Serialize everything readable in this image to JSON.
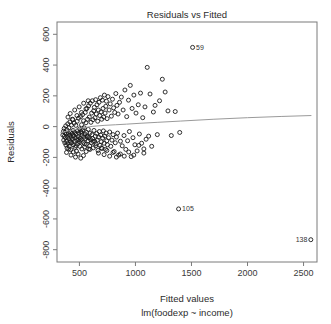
{
  "chart_data": {
    "type": "scatter",
    "title": "Residuals vs Fitted",
    "xlabel": "Fitted values",
    "sublabel": "lm(foodexp ~ income)",
    "ylabel": "Residuals",
    "xlim": [
      300,
      2620
    ],
    "ylim": [
      -880,
      680
    ],
    "xticks": [
      500,
      1000,
      1500,
      2000,
      2500
    ],
    "xtick_labels": [
      "500",
      "1000",
      "1500",
      "2000",
      "2500"
    ],
    "yticks": [
      600,
      400,
      200,
      0,
      -200,
      -400,
      -600,
      -800
    ],
    "ytick_labels": [
      "600",
      "400",
      "200",
      "0",
      "-200",
      "-400",
      "-600",
      "-800"
    ],
    "grid": false,
    "legend": "none",
    "marker": "open-circle",
    "marker_color": "#1a1a1a",
    "smoother_color": "#9a9a9a",
    "frame_color": "#7a7a7a",
    "background": "#ffffff",
    "labeled_points": [
      {
        "id": "59",
        "x": 1510,
        "y": 515,
        "label_side": "right"
      },
      {
        "id": "105",
        "x": 1385,
        "y": -535,
        "label_side": "right"
      },
      {
        "id": "138",
        "x": 2565,
        "y": -735,
        "label_side": "left"
      }
    ],
    "smooth_line": [
      [
        330,
        -40
      ],
      [
        420,
        -25
      ],
      [
        520,
        -10
      ],
      [
        620,
        2
      ],
      [
        720,
        8
      ],
      [
        820,
        12
      ],
      [
        920,
        16
      ],
      [
        1050,
        22
      ],
      [
        1200,
        28
      ],
      [
        1400,
        36
      ],
      [
        1700,
        48
      ],
      [
        2000,
        58
      ],
      [
        2300,
        66
      ],
      [
        2570,
        72
      ]
    ],
    "points": [
      [
        352,
        -55
      ],
      [
        358,
        -30
      ],
      [
        360,
        -88
      ],
      [
        364,
        -12
      ],
      [
        366,
        -62
      ],
      [
        370,
        -105
      ],
      [
        372,
        -38
      ],
      [
        375,
        -72
      ],
      [
        378,
        5
      ],
      [
        380,
        -120
      ],
      [
        383,
        -48
      ],
      [
        386,
        -95
      ],
      [
        388,
        -20
      ],
      [
        390,
        -140
      ],
      [
        393,
        -65
      ],
      [
        396,
        18
      ],
      [
        398,
        -110
      ],
      [
        401,
        -42
      ],
      [
        404,
        -78
      ],
      [
        406,
        -8
      ],
      [
        409,
        -128
      ],
      [
        412,
        -55
      ],
      [
        415,
        30
      ],
      [
        418,
        -92
      ],
      [
        420,
        -35
      ],
      [
        423,
        -150
      ],
      [
        426,
        -68
      ],
      [
        429,
        10
      ],
      [
        432,
        -105
      ],
      [
        435,
        -45
      ],
      [
        438,
        -82
      ],
      [
        441,
        45
      ],
      [
        444,
        -25
      ],
      [
        447,
        -118
      ],
      [
        450,
        -60
      ],
      [
        453,
        22
      ],
      [
        456,
        -95
      ],
      [
        459,
        -38
      ],
      [
        462,
        -135
      ],
      [
        465,
        -72
      ],
      [
        468,
        8
      ],
      [
        471,
        -50
      ],
      [
        474,
        -160
      ],
      [
        477,
        -88
      ],
      [
        480,
        35
      ],
      [
        483,
        -28
      ],
      [
        486,
        -112
      ],
      [
        489,
        -65
      ],
      [
        492,
        55
      ],
      [
        495,
        -42
      ],
      [
        498,
        -98
      ],
      [
        501,
        -15
      ],
      [
        504,
        -128
      ],
      [
        507,
        -75
      ],
      [
        510,
        65
      ],
      [
        513,
        -32
      ],
      [
        516,
        -88
      ],
      [
        519,
        12
      ],
      [
        522,
        -145
      ],
      [
        525,
        -58
      ],
      [
        528,
        78
      ],
      [
        531,
        -22
      ],
      [
        534,
        -102
      ],
      [
        537,
        38
      ],
      [
        540,
        -68
      ],
      [
        543,
        -8
      ],
      [
        546,
        -132
      ],
      [
        549,
        -48
      ],
      [
        552,
        92
      ],
      [
        555,
        -78
      ],
      [
        558,
        25
      ],
      [
        561,
        -115
      ],
      [
        564,
        -38
      ],
      [
        567,
        118
      ],
      [
        570,
        -62
      ],
      [
        573,
        48
      ],
      [
        576,
        -92
      ],
      [
        579,
        -18
      ],
      [
        582,
        135
      ],
      [
        585,
        -72
      ],
      [
        588,
        62
      ],
      [
        591,
        -125
      ],
      [
        594,
        -42
      ],
      [
        597,
        152
      ],
      [
        600,
        -85
      ],
      [
        603,
        28
      ],
      [
        606,
        -105
      ],
      [
        609,
        88
      ],
      [
        612,
        -52
      ],
      [
        615,
        168
      ],
      [
        618,
        -78
      ],
      [
        621,
        45
      ],
      [
        624,
        -138
      ],
      [
        627,
        102
      ],
      [
        630,
        -25
      ],
      [
        633,
        125
      ],
      [
        636,
        -95
      ],
      [
        639,
        58
      ],
      [
        642,
        -62
      ],
      [
        645,
        175
      ],
      [
        648,
        -112
      ],
      [
        651,
        82
      ],
      [
        654,
        -45
      ],
      [
        657,
        142
      ],
      [
        660,
        -88
      ],
      [
        663,
        35
      ],
      [
        666,
        -155
      ],
      [
        669,
        108
      ],
      [
        672,
        -68
      ],
      [
        675,
        158
      ],
      [
        678,
        -32
      ],
      [
        681,
        72
      ],
      [
        684,
        -122
      ],
      [
        687,
        188
      ],
      [
        690,
        -55
      ],
      [
        693,
        95
      ],
      [
        696,
        -98
      ],
      [
        699,
        48
      ],
      [
        702,
        -142
      ],
      [
        705,
        172
      ],
      [
        708,
        -75
      ],
      [
        711,
        118
      ],
      [
        714,
        -28
      ],
      [
        717,
        62
      ],
      [
        720,
        -108
      ],
      [
        723,
        205
      ],
      [
        726,
        -62
      ],
      [
        729,
        88
      ],
      [
        732,
        -148
      ],
      [
        735,
        132
      ],
      [
        738,
        -42
      ],
      [
        741,
        165
      ],
      [
        744,
        -92
      ],
      [
        747,
        52
      ],
      [
        750,
        -118
      ],
      [
        755,
        195
      ],
      [
        760,
        -72
      ],
      [
        765,
        108
      ],
      [
        770,
        -35
      ],
      [
        775,
        148
      ],
      [
        780,
        -128
      ],
      [
        785,
        68
      ],
      [
        790,
        -88
      ],
      [
        795,
        178
      ],
      [
        800,
        -52
      ],
      [
        805,
        122
      ],
      [
        810,
        -162
      ],
      [
        815,
        92
      ],
      [
        820,
        -105
      ],
      [
        825,
        215
      ],
      [
        830,
        -68
      ],
      [
        835,
        138
      ],
      [
        840,
        -42
      ],
      [
        845,
        82
      ],
      [
        850,
        -185
      ],
      [
        858,
        158
      ],
      [
        866,
        -95
      ],
      [
        874,
        192
      ],
      [
        882,
        -125
      ],
      [
        890,
        108
      ],
      [
        898,
        -58
      ],
      [
        906,
        238
      ],
      [
        914,
        -148
      ],
      [
        922,
        65
      ],
      [
        930,
        -92
      ],
      [
        938,
        172
      ],
      [
        946,
        -32
      ],
      [
        954,
        268
      ],
      [
        962,
        -195
      ],
      [
        970,
        118
      ],
      [
        978,
        -72
      ],
      [
        986,
        205
      ],
      [
        995,
        -118
      ],
      [
        1005,
        88
      ],
      [
        1015,
        -158
      ],
      [
        1025,
        142
      ],
      [
        1035,
        -48
      ],
      [
        1045,
        218
      ],
      [
        1055,
        -108
      ],
      [
        1065,
        58
      ],
      [
        1075,
        -172
      ],
      [
        1085,
        128
      ],
      [
        1095,
        -82
      ],
      [
        1105,
        385
      ],
      [
        1118,
        -62
      ],
      [
        1130,
        212
      ],
      [
        1145,
        -128
      ],
      [
        1160,
        95
      ],
      [
        1175,
        138
      ],
      [
        1195,
        -52
      ],
      [
        1215,
        168
      ],
      [
        1240,
        308
      ],
      [
        1265,
        225
      ],
      [
        1290,
        102
      ],
      [
        1320,
        -58
      ],
      [
        1355,
        98
      ],
      [
        1395,
        -38
      ],
      [
        420,
        -102
      ],
      [
        445,
        -58
      ],
      [
        470,
        -125
      ],
      [
        495,
        -85
      ],
      [
        520,
        -42
      ],
      [
        545,
        -112
      ],
      [
        570,
        -68
      ],
      [
        595,
        -148
      ],
      [
        620,
        -95
      ],
      [
        645,
        -125
      ],
      [
        670,
        -172
      ],
      [
        695,
        -138
      ],
      [
        720,
        -182
      ],
      [
        745,
        -155
      ],
      [
        770,
        -192
      ],
      [
        800,
        -168
      ],
      [
        830,
        -198
      ],
      [
        865,
        -178
      ],
      [
        900,
        -192
      ],
      [
        940,
        -165
      ],
      [
        985,
        -185
      ],
      [
        1030,
        -122
      ],
      [
        1075,
        -145
      ],
      [
        398,
        62
      ],
      [
        418,
        85
      ],
      [
        438,
        48
      ],
      [
        458,
        108
      ],
      [
        478,
        72
      ],
      [
        498,
        128
      ],
      [
        518,
        92
      ],
      [
        538,
        152
      ],
      [
        558,
        115
      ],
      [
        578,
        168
      ],
      [
        385,
        -168
      ],
      [
        405,
        -145
      ],
      [
        425,
        -185
      ],
      [
        445,
        -165
      ],
      [
        465,
        -198
      ],
      [
        488,
        -178
      ],
      [
        512,
        -205
      ],
      [
        536,
        -188
      ],
      [
        560,
        -162
      ],
      [
        584,
        -145
      ]
    ]
  }
}
